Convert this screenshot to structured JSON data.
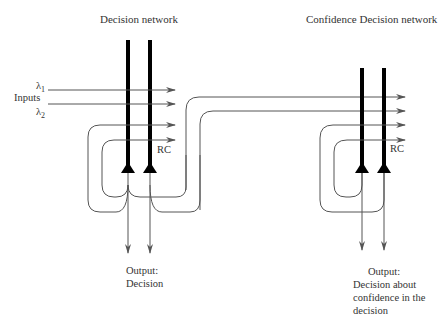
{
  "diagram": {
    "left_network": {
      "title": "Decision network",
      "input_label": "Inputs",
      "input_1": "λ1",
      "input_2": "λ2",
      "rc_label": "RC",
      "output_label": "Output:",
      "output_desc": "Decision"
    },
    "right_network": {
      "title": "Confidence Decision network",
      "rc_label": "RC",
      "output_label": "Output:",
      "output_line_1": "Decision about",
      "output_line_2": "confidence in the",
      "output_line_3": "decision"
    },
    "colors": {
      "thick_line": "#000000",
      "thin_line": "#555555",
      "text": "#333333"
    }
  }
}
